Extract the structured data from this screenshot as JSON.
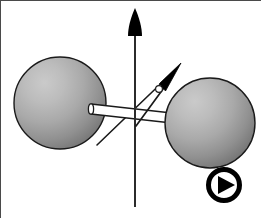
{
  "figure": {
    "title": "Rotating diatomic molecule with angular momentum vector",
    "background_color": "#ffffff",
    "width": 261,
    "height": 218,
    "border": {
      "present": true,
      "edges": "left-top",
      "color": "#4a4a4a",
      "width": 1
    }
  },
  "atoms": [
    {
      "name": "left-atom",
      "label": "",
      "cx": 60,
      "cy": 103,
      "r": 46,
      "fill_light": "#c6c6c6",
      "fill_mid": "#a8a8a8",
      "fill_dark": "#767676",
      "stroke": "#1a1a1a",
      "stroke_width": 1.4,
      "highlight_cx": 40,
      "highlight_cy": 78
    },
    {
      "name": "right-atom",
      "label": "",
      "cx": 210,
      "cy": 123,
      "r": 45,
      "fill_light": "#c6c6c6",
      "fill_mid": "#a8a8a8",
      "fill_dark": "#767676",
      "stroke": "#1a1a1a",
      "stroke_width": 1.4,
      "highlight_cx": 191,
      "highlight_cy": 99
    }
  ],
  "bond": {
    "name": "bond-rod",
    "label": "",
    "x1": 92,
    "y1": 109,
    "x2": 182,
    "y2": 119,
    "thickness": 11,
    "fill": "#ffffff",
    "stroke": "#1a1a1a",
    "stroke_width": 1.4
  },
  "axes": [
    {
      "name": "rotation-axis",
      "label": "",
      "type": "vertical-axis-arrow",
      "x1": 135,
      "y1": 207,
      "x2": 135,
      "y2": 10,
      "stroke": "#2b2b2b",
      "stroke_width": 2.0,
      "arrowhead": {
        "shape": "teardrop",
        "fill": "#000000",
        "tip_x": 135,
        "tip_y": 8,
        "half_width": 7,
        "length": 30
      }
    },
    {
      "name": "molecular-axis-line",
      "label": "",
      "type": "diagonal-line",
      "x1": 97,
      "y1": 145,
      "x2": 172,
      "y2": 73,
      "stroke": "#1a1a1a",
      "stroke_width": 1.6,
      "arrowhead": {
        "shape": "none"
      }
    }
  ],
  "vectors": [
    {
      "name": "angular-momentum-vector",
      "label": "",
      "type": "diagonal-arrow",
      "x1": 136,
      "y1": 125,
      "x2": 178,
      "y2": 67,
      "stroke": "#1a1a1a",
      "stroke_width": 1.6,
      "arrowhead": {
        "shape": "narrow-triangle",
        "fill": "#000000",
        "tip_x": 180,
        "tip_y": 64,
        "half_width": 6,
        "length": 26
      },
      "origin_marker": {
        "name": "vector-origin-dot",
        "shape": "circle",
        "cx": 159,
        "cy": 89,
        "r": 3.4,
        "fill": "#ffffff",
        "stroke": "#1a1a1a",
        "stroke_width": 1.2
      }
    }
  ],
  "play_button": {
    "name": "play-button-icon",
    "label": "",
    "cx": 224,
    "cy": 185,
    "outer_r": 18,
    "ring_width": 5,
    "ring_color": "#000000",
    "fill": "#ffffff",
    "triangle": {
      "points": "217,175 217,195 235,185",
      "fill": "#000000"
    }
  },
  "legend": {
    "entries": []
  },
  "chart_data": {
    "type": "diagram",
    "title": "Rotating diatomic molecule",
    "elements": [
      "left-atom",
      "right-atom",
      "bond-rod",
      "rotation-axis",
      "molecular-axis-line",
      "angular-momentum-vector",
      "play-button-icon"
    ],
    "annotations": []
  }
}
